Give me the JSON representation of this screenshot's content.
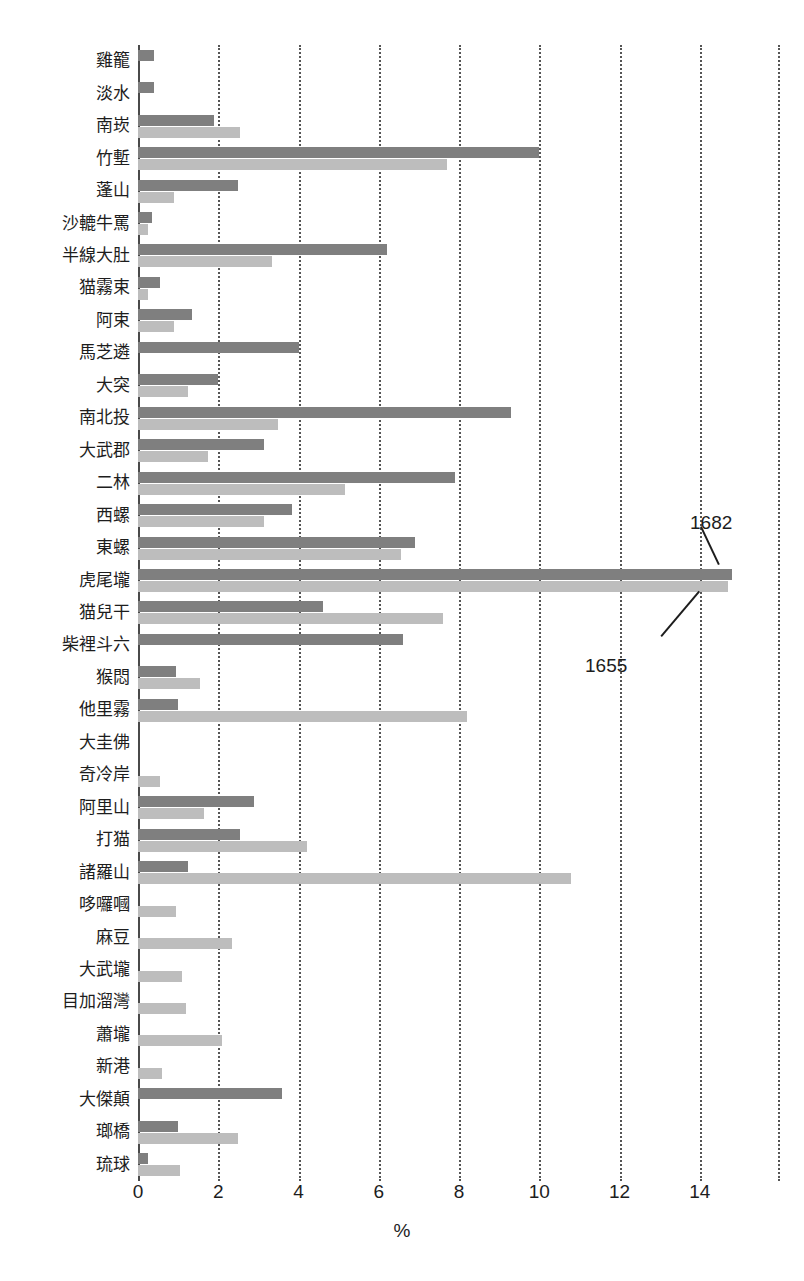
{
  "chart_data": {
    "type": "bar",
    "orientation": "horizontal",
    "title": "",
    "xlabel": "%",
    "ylabel": "",
    "xlim": [
      0,
      16
    ],
    "xticks": [
      0,
      2,
      4,
      6,
      8,
      10,
      12,
      14
    ],
    "xticklabels": [
      "0",
      "2",
      "4",
      "6",
      "8",
      "10",
      "12",
      "14"
    ],
    "grid": "vertical-dotted",
    "legend_position": "none",
    "series": [
      {
        "name": "1682",
        "color": "#7f7f7f",
        "values": [
          0.4,
          0.4,
          1.9,
          10.0,
          2.5,
          0.35,
          6.2,
          0.55,
          1.35,
          4.0,
          2.0,
          9.3,
          3.15,
          7.9,
          3.85,
          6.9,
          14.8,
          4.6,
          6.6,
          0.95,
          1.0,
          0.0,
          0.0,
          2.9,
          2.55,
          1.25,
          0.0,
          0.0,
          0.0,
          0.0,
          0.0,
          0.0,
          3.6,
          1.0,
          0.25
        ]
      },
      {
        "name": "1655",
        "color": "#bdbdbd",
        "values": [
          0.0,
          0.0,
          2.55,
          7.7,
          0.9,
          0.25,
          3.35,
          0.25,
          0.9,
          0.0,
          1.25,
          3.5,
          1.75,
          5.15,
          3.15,
          6.55,
          14.7,
          7.6,
          0.0,
          1.55,
          8.2,
          0.0,
          0.55,
          1.65,
          4.2,
          10.8,
          0.95,
          2.35,
          1.1,
          1.2,
          2.1,
          0.6,
          0.0,
          2.5,
          1.05
        ]
      }
    ],
    "categories": [
      "雞籠",
      "淡水",
      "南崁",
      "竹塹",
      "蓬山",
      "沙轆牛罵",
      "半線大肚",
      "猫霧束",
      "阿束",
      "馬芝遴",
      "大突",
      "南北投",
      "大武郡",
      "二林",
      "西螺",
      "東螺",
      "虎尾壠",
      "猫兒干",
      "柴裡斗六",
      "猴悶",
      "他里霧",
      "大圭佛",
      "奇冷岸",
      "阿里山",
      "打猫",
      "諸羅山",
      "哆囉嘓",
      "麻豆",
      "大武壠",
      "目加溜灣",
      "蕭壠",
      "新港",
      "大傑顛",
      "瑯橋",
      "琉球"
    ],
    "annotations": [
      {
        "text": "1682",
        "x_px": 690,
        "y_px": 512,
        "series": "1682"
      },
      {
        "text": "1655",
        "x_px": 585,
        "y_px": 655,
        "series": "1655"
      }
    ]
  }
}
